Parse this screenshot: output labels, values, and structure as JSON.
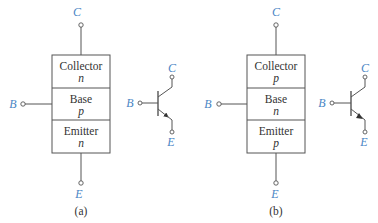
{
  "colors": {
    "terminal_label": "#4a86c5",
    "line": "#555555",
    "text": "#333333"
  },
  "diagrams": [
    {
      "caption": "(a)",
      "transistor_type": "npn",
      "terminals": {
        "collector": "C",
        "base": "B",
        "emitter": "E"
      },
      "regions": [
        {
          "name": "Collector",
          "doping": "n"
        },
        {
          "name": "Base",
          "doping": "p"
        },
        {
          "name": "Emitter",
          "doping": "n"
        }
      ],
      "symbol": {
        "terminals": {
          "collector": "C",
          "base": "B",
          "emitter": "E"
        },
        "emitter_arrow": "outward"
      }
    },
    {
      "caption": "(b)",
      "transistor_type": "pnp",
      "terminals": {
        "collector": "C",
        "base": "B",
        "emitter": "E"
      },
      "regions": [
        {
          "name": "Collector",
          "doping": "p"
        },
        {
          "name": "Base",
          "doping": "n"
        },
        {
          "name": "Emitter",
          "doping": "p"
        }
      ],
      "symbol": {
        "terminals": {
          "collector": "C",
          "base": "B",
          "emitter": "E"
        },
        "emitter_arrow": "inward"
      }
    }
  ]
}
